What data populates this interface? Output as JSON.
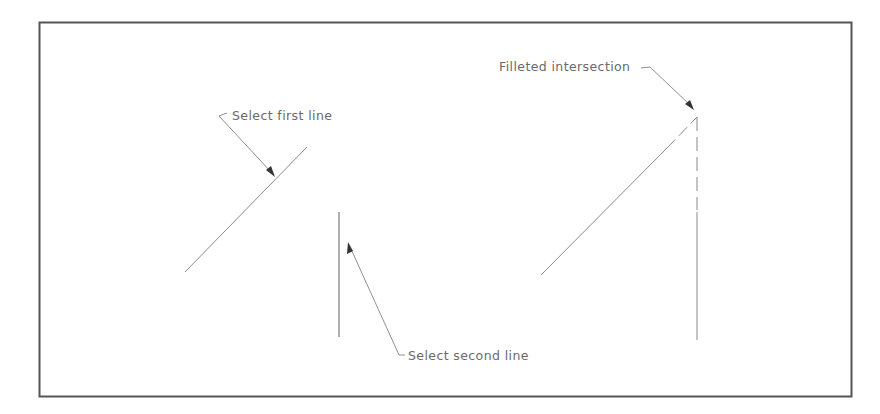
{
  "diagram": {
    "colors": {
      "frame": "#555555",
      "geometry": "#8a8a8a",
      "leader": "#8f8f8f",
      "arrowhead": "#333333",
      "text": "#6a6a6a",
      "background": "#ffffff"
    },
    "labels": {
      "select_first_line": "Select first line",
      "select_second_line": "Select second line",
      "filleted_intersection": "Filleted intersection"
    },
    "left_example": {
      "first_line": {
        "x1": 185,
        "y1": 272,
        "x2": 307,
        "y2": 147
      },
      "second_line": {
        "x1": 339,
        "y1": 212,
        "x2": 339,
        "y2": 337
      }
    },
    "right_example": {
      "diagonal_line": {
        "x1": 541,
        "y1": 275,
        "x2": 697,
        "y2": 117
      },
      "vertical_line": {
        "x1": 697,
        "y1": 117,
        "x2": 697,
        "y2": 340
      },
      "intersection_point": {
        "x": 697,
        "y": 117
      }
    }
  }
}
